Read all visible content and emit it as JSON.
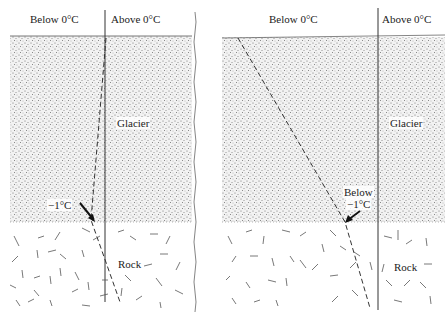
{
  "panels": [
    {
      "id": "left",
      "labels": {
        "below": "Below 0°C",
        "above": "Above 0°C",
        "glacier": "Glacier",
        "rock": "Rock",
        "isotherm": "−1°C"
      }
    },
    {
      "id": "right",
      "labels": {
        "below": "Below 0°C",
        "above": "Above 0°C",
        "glacier": "Glacier",
        "rock": "Rock",
        "isotherm_line1": "Below",
        "isotherm_line2": "−1°C"
      }
    }
  ],
  "colors": {
    "ink": "#222222",
    "stipple": "#6a6a6a",
    "background": "#ffffff"
  }
}
